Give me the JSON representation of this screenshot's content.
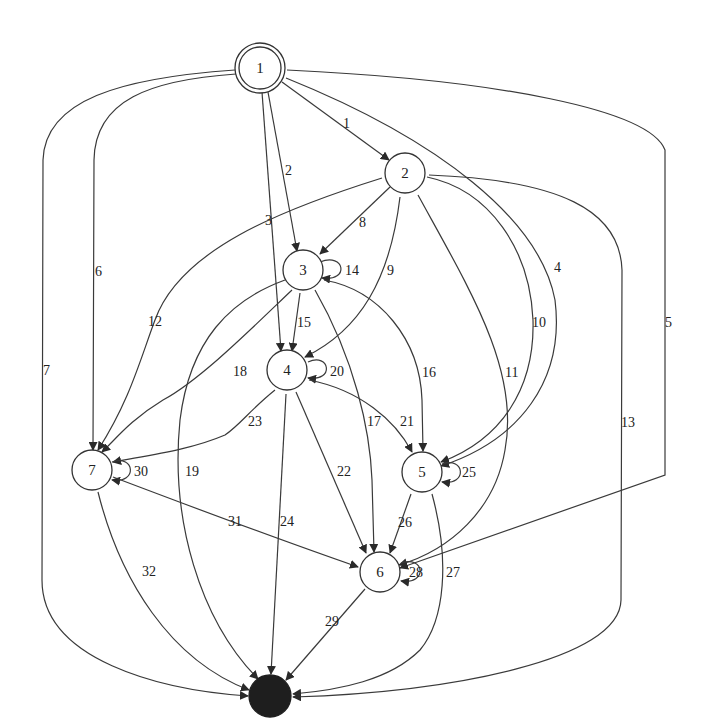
{
  "graph": {
    "type": "directed-state-graph",
    "nodes": [
      {
        "id": "1",
        "label": "1",
        "kind": "initial",
        "x": 260,
        "y": 68
      },
      {
        "id": "2",
        "label": "2",
        "kind": "state",
        "x": 405,
        "y": 173
      },
      {
        "id": "3",
        "label": "3",
        "kind": "state",
        "x": 303,
        "y": 270
      },
      {
        "id": "4",
        "label": "4",
        "kind": "state",
        "x": 287,
        "y": 370
      },
      {
        "id": "5",
        "label": "5",
        "kind": "state",
        "x": 422,
        "y": 472
      },
      {
        "id": "6",
        "label": "6",
        "kind": "state",
        "x": 380,
        "y": 572
      },
      {
        "id": "7",
        "label": "7",
        "kind": "state",
        "x": 92,
        "y": 470
      },
      {
        "id": "end",
        "label": "",
        "kind": "final",
        "x": 270,
        "y": 696
      }
    ],
    "edges": [
      {
        "label": "1",
        "from": "1",
        "to": "2"
      },
      {
        "label": "2",
        "from": "1",
        "to": "3"
      },
      {
        "label": "3",
        "from": "1",
        "to": "4"
      },
      {
        "label": "4",
        "from": "1",
        "to": "5"
      },
      {
        "label": "5",
        "from": "1",
        "to": "6"
      },
      {
        "label": "6",
        "from": "1",
        "to": "7"
      },
      {
        "label": "7",
        "from": "1",
        "to": "end"
      },
      {
        "label": "8",
        "from": "2",
        "to": "3"
      },
      {
        "label": "9",
        "from": "2",
        "to": "4"
      },
      {
        "label": "10",
        "from": "2",
        "to": "5"
      },
      {
        "label": "11",
        "from": "2",
        "to": "6"
      },
      {
        "label": "12",
        "from": "2",
        "to": "7"
      },
      {
        "label": "13",
        "from": "2",
        "to": "end"
      },
      {
        "label": "14",
        "from": "3",
        "to": "3"
      },
      {
        "label": "15",
        "from": "3",
        "to": "4"
      },
      {
        "label": "16",
        "from": "3",
        "to": "5"
      },
      {
        "label": "17",
        "from": "3",
        "to": "6"
      },
      {
        "label": "18",
        "from": "3",
        "to": "7"
      },
      {
        "label": "19",
        "from": "3",
        "to": "end"
      },
      {
        "label": "20",
        "from": "4",
        "to": "4"
      },
      {
        "label": "21",
        "from": "4",
        "to": "5"
      },
      {
        "label": "22",
        "from": "4",
        "to": "6"
      },
      {
        "label": "23",
        "from": "4",
        "to": "7"
      },
      {
        "label": "24",
        "from": "4",
        "to": "end"
      },
      {
        "label": "25",
        "from": "5",
        "to": "5"
      },
      {
        "label": "26",
        "from": "5",
        "to": "6"
      },
      {
        "label": "27",
        "from": "5",
        "to": "end"
      },
      {
        "label": "28",
        "from": "6",
        "to": "6"
      },
      {
        "label": "29",
        "from": "6",
        "to": "end"
      },
      {
        "label": "30",
        "from": "7",
        "to": "7"
      },
      {
        "label": "31",
        "from": "7",
        "to": "6"
      },
      {
        "label": "32",
        "from": "7",
        "to": "end"
      }
    ]
  }
}
